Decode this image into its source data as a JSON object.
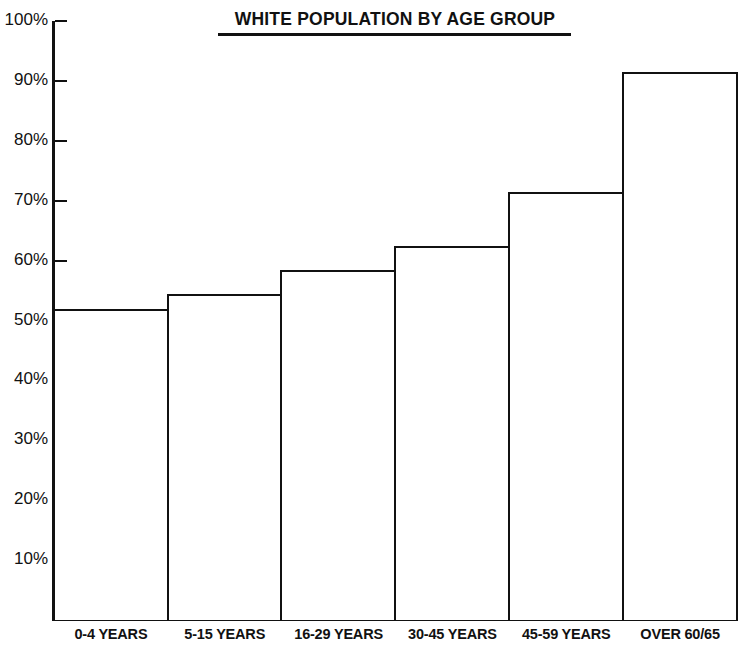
{
  "chart_data": {
    "type": "bar",
    "title": "WHITE POPULATION BY AGE GROUP",
    "xlabel": "",
    "ylabel": "",
    "categories": [
      "0-4 YEARS",
      "5-15 YEARS",
      "16-29 YEARS",
      "30-45 YEARS",
      "45-59 YEARS",
      "OVER 60/65"
    ],
    "values": [
      52,
      54.5,
      58.5,
      62.5,
      71.5,
      91.5
    ],
    "ylim": [
      0,
      100
    ],
    "ytick_labels": [
      "100%",
      "90%",
      "80%",
      "70%",
      "60%",
      "50%",
      "40%",
      "30%",
      "20%",
      "10%"
    ],
    "ytick_values": [
      100,
      90,
      80,
      70,
      60,
      50,
      40,
      30,
      20,
      10
    ],
    "grid": false,
    "legend": null,
    "bar_color": "#ffffff",
    "line_color": "#111111",
    "value_unit": "%"
  }
}
